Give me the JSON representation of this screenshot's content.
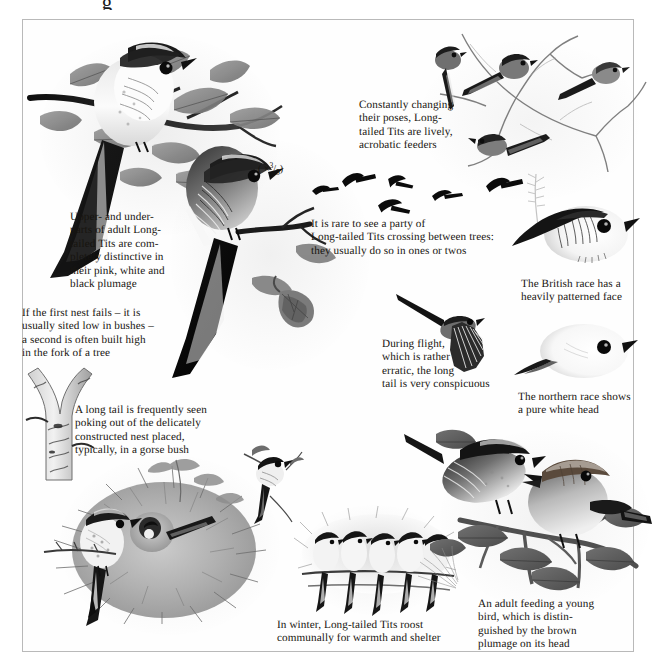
{
  "plate": {
    "title_glyph": "g",
    "scale_note": "( × 3/5 )",
    "scale_note_parts": {
      "open": "( ×",
      "numerator": "3",
      "denominator": "5",
      "close": ")"
    }
  },
  "captions": [
    {
      "id": "plumage",
      "name": "caption-plumage",
      "text": "Upper- and under-\nparts of adult Long-\ntailed Tits are com-\npletely distinctive in\ntheir pink, white and\nblack plumage"
    },
    {
      "id": "nest-site",
      "name": "caption-nest-site",
      "text": "If the first nest fails – it is\nusually sited low in bushes –\na second is often built high\nin the fork of a tree"
    },
    {
      "id": "long-tail-nest",
      "name": "caption-long-tail-nest",
      "text": "A long tail is frequently seen\npoking out of the delicately\nconstructed nest placed,\ntypically, in a gorse bush"
    },
    {
      "id": "poses",
      "name": "caption-poses",
      "text": "Constantly changing\ntheir poses, Long-\ntailed Tits are lively,\nacrobatic feeders"
    },
    {
      "id": "party-crossing",
      "name": "caption-party-crossing",
      "text": "It is rare to see a party of\nLong-tailed Tits crossing between trees:\nthey usually do so in ones or twos"
    },
    {
      "id": "during-flight",
      "name": "caption-during-flight",
      "text": "During flight,\nwhich is rather\nerratic, the long\ntail is very conspicuous"
    },
    {
      "id": "british-race",
      "name": "caption-british-race",
      "text": "The British race has a\nheavily patterned face"
    },
    {
      "id": "northern-race",
      "name": "caption-northern-race",
      "text": "The northern race shows\na pure white head"
    },
    {
      "id": "winter-roost",
      "name": "caption-winter-roost",
      "text": "In winter, Long-tailed Tits roost\ncommunally for warmth and shelter"
    },
    {
      "id": "adult-feeding",
      "name": "caption-adult-feeding",
      "text": "An adult feeding a young\nbird, which is distin-\nguished by the brown\nplumage on its head"
    }
  ],
  "figures": [
    {
      "name": "figure-perched-tit-upper",
      "label": "Long-tailed Tit perched on hawthorn branch, upperparts"
    },
    {
      "name": "figure-perched-tit-lower",
      "label": "Long-tailed Tit perched, underparts and long tail"
    },
    {
      "name": "figure-tree-fork",
      "label": "Fork of a tree where second nest is built"
    },
    {
      "name": "figure-branch-flock",
      "label": "Flock of Long-tailed Tits in bare branches"
    },
    {
      "name": "figure-flying-silhouettes",
      "label": "Six flying Long-tailed Tit silhouettes"
    },
    {
      "name": "figure-flight-bird",
      "label": "Long-tailed Tit in flight with spread wing"
    },
    {
      "name": "figure-head-british",
      "label": "Head portrait of British race"
    },
    {
      "name": "figure-head-northern",
      "label": "Head portrait of northern race"
    },
    {
      "name": "figure-gorse-nest",
      "label": "Nest in gorse bush with adult perched alongside"
    },
    {
      "name": "figure-roosting-row",
      "label": "Five Long-tailed Tits roosting in a row"
    },
    {
      "name": "figure-feeding-pair",
      "label": "Adult feeding a young bird on a branch"
    },
    {
      "name": "figure-falling-leaf",
      "label": "Hawthorn leaf on a twig"
    },
    {
      "name": "figure-small-tit-twig",
      "label": "Small tit perched on a twig"
    }
  ],
  "colors": {
    "ink": "#17140f",
    "border": "#b9b9b9",
    "paper": "#ffffff",
    "wash_grey": "#8c8c8c",
    "black_plumage": "#111111"
  }
}
